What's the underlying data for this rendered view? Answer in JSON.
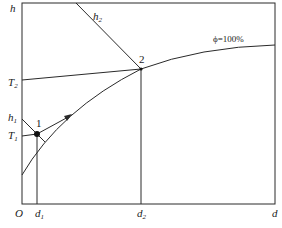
{
  "diagram": {
    "type": "psychrometric h-d chart",
    "axes": {
      "y_label": "h",
      "x_label": "d",
      "origin_label": "O"
    },
    "y_labels": [
      {
        "name": "T",
        "sub": "2"
      },
      {
        "name": "h",
        "sub": "1"
      },
      {
        "name": "T",
        "sub": "1"
      }
    ],
    "x_labels": [
      {
        "name": "d",
        "sub": "1"
      },
      {
        "name": "d",
        "sub": "2"
      }
    ],
    "enthalpy_line_label": {
      "name": "h",
      "sub": "2"
    },
    "points": [
      {
        "id": "1",
        "label": "1"
      },
      {
        "id": "2",
        "label": "2"
      }
    ],
    "saturation_curve_label": "ϕ=100%",
    "colors": {
      "line": "#2a2a2a",
      "background": "#ffffff"
    }
  }
}
